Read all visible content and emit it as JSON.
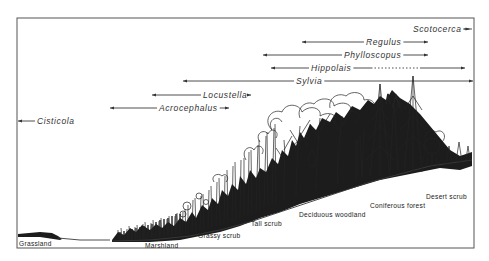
{
  "figure": {
    "type": "habitat-range-diagram",
    "frame": {
      "x": 17,
      "y": 18,
      "width": 457,
      "height": 230
    }
  },
  "genera": [
    {
      "name": "Scotocerca",
      "label_x": 413,
      "y": 29,
      "start": 413,
      "end": 472,
      "arrow_left": false,
      "arrow_right": true,
      "dotted": null
    },
    {
      "name": "Regulus",
      "label_x": 366,
      "y": 42,
      "start": 302,
      "end": 428,
      "arrow_left": true,
      "arrow_right": true,
      "dotted": null
    },
    {
      "name": "Phylloscopus",
      "label_x": 344,
      "y": 55,
      "start": 263,
      "end": 428,
      "arrow_left": true,
      "arrow_right": true,
      "dotted": null
    },
    {
      "name": "Hippolais",
      "label_x": 311,
      "y": 68,
      "start": 271,
      "end": 465,
      "arrow_left": true,
      "arrow_right": true,
      "dotted": [
        371,
        420
      ]
    },
    {
      "name": "Sylvia",
      "label_x": 296,
      "y": 81,
      "start": 183,
      "end": 473,
      "arrow_left": true,
      "arrow_right": true,
      "dotted": null
    },
    {
      "name": "Locustella",
      "label_x": 203,
      "y": 95,
      "start": 152,
      "end": 251,
      "arrow_left": true,
      "arrow_right": true,
      "dotted": null
    },
    {
      "name": "Acrocephalus",
      "label_x": 159,
      "y": 108,
      "start": 110,
      "end": 229,
      "arrow_left": true,
      "arrow_right": true,
      "dotted": null
    },
    {
      "name": "Cisticola",
      "label_x": 37,
      "y": 121,
      "start": 18,
      "end": 20,
      "arrow_left": true,
      "arrow_right": false,
      "dotted": null
    }
  ],
  "habitats": [
    {
      "name": "Grassland",
      "x": 19,
      "y": 246
    },
    {
      "name": "Marshland",
      "x": 145,
      "y": 248
    },
    {
      "name": "Grassy scrub",
      "x": 198,
      "y": 238
    },
    {
      "name": "Tall scrub",
      "x": 251,
      "y": 226
    },
    {
      "name": "Deciduous woodland",
      "x": 299,
      "y": 217
    },
    {
      "name": "Coniferous forest",
      "x": 370,
      "y": 208
    },
    {
      "name": "Desert scrub",
      "x": 426,
      "y": 199
    }
  ]
}
